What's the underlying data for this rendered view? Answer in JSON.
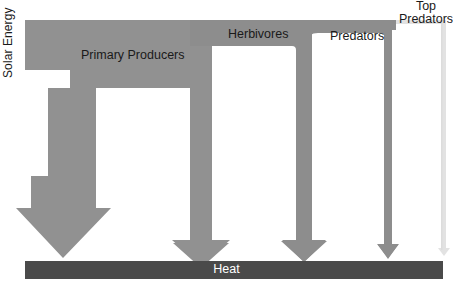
{
  "diagram": {
    "type": "energy-flow-pyramid",
    "canvas": {
      "width": 453,
      "height": 293
    },
    "colors": {
      "band_gray": "#919191",
      "band_gray_mid": "#8d8d8d",
      "top_predator_faint": "#e2e2e2",
      "heat_bar": "#4a4a4a",
      "background": "#ffffff",
      "text": "#1a1a1a",
      "heat_text": "#ffffff"
    },
    "labels": {
      "solar_energy": "Solar Energy",
      "primary_producers": "Primary Producers",
      "herbivores": "Herbivores",
      "predators": "Predators",
      "top_predators_line1": "Top",
      "top_predators_line2": "Predators",
      "heat": "Heat"
    },
    "trophic_levels": [
      {
        "name": "Solar Energy",
        "order": 0,
        "relative_width": 1.0
      },
      {
        "name": "Primary Producers",
        "order": 1,
        "relative_width": 0.46
      },
      {
        "name": "Herbivores",
        "order": 2,
        "relative_width": 0.17
      },
      {
        "name": "Predators",
        "order": 3,
        "relative_width": 0.075
      },
      {
        "name": "Top Predators",
        "order": 4,
        "relative_width": 0.02
      }
    ],
    "heat_losses": [
      {
        "from": "Primary Producers",
        "arrow": "largest"
      },
      {
        "from": "Herbivores",
        "arrow": "medium"
      },
      {
        "from": "Predators",
        "arrow": "small"
      },
      {
        "from": "Top Predators",
        "arrow": "tiny"
      }
    ],
    "sink": "Heat"
  }
}
